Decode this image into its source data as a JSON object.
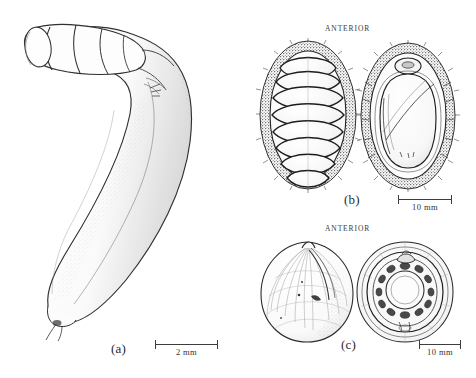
{
  "figure": {
    "type": "scientific-illustration-plate",
    "background_color": "#ffffff",
    "ink_color": "#2b2b2b",
    "width": 476,
    "height": 378
  },
  "panels": [
    {
      "id": "a",
      "label": "(a)",
      "subject": "elongate worm-like invertebrate with swollen anterior proboscis and tapering posterior body",
      "views": [
        "whole animal, lateral"
      ],
      "anterior_label": null,
      "scale": {
        "text": "2 mm",
        "value": 2,
        "unit": "mm"
      }
    },
    {
      "id": "b",
      "label": "(b)",
      "subject": "chiton (polyplacophoran) with eight overlapping dorsal valves and spiculose girdle",
      "views": [
        "dorsal",
        "ventral"
      ],
      "anterior_label": "ANTERIOR",
      "scale": {
        "text": "10 mm",
        "value": 10,
        "unit": "mm"
      }
    },
    {
      "id": "c",
      "label": "(c)",
      "subject": "rounded bivalve shell showing exterior sculpture and interior hinge dentition",
      "views": [
        "exterior",
        "interior"
      ],
      "anterior_label": "ANTERIOR",
      "scale": {
        "text": "10 mm",
        "value": 10,
        "unit": "mm"
      }
    }
  ],
  "labels": {
    "panel_a": "(a)",
    "panel_b": "(b)",
    "panel_c": "(c)",
    "anterior_b": "ANTERIOR",
    "anterior_c": "ANTERIOR",
    "scale_a": "2  mm",
    "scale_b": "10  mm",
    "scale_c": "10  mm"
  }
}
